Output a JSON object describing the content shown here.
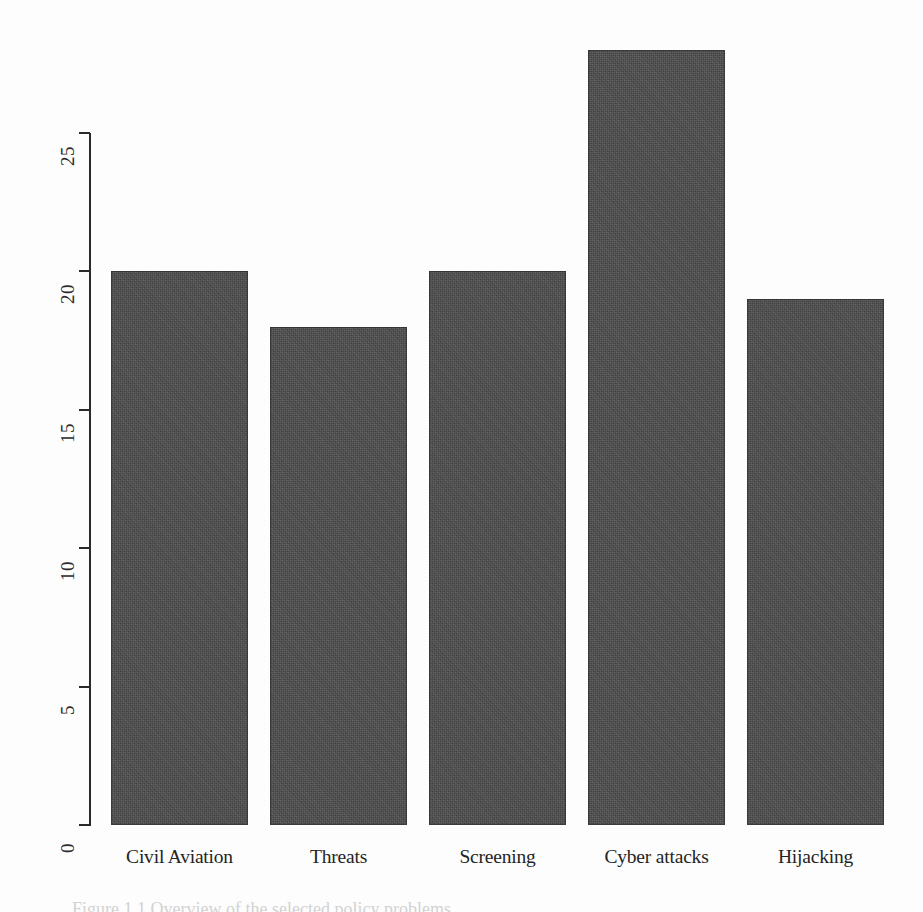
{
  "figure": {
    "background_color": "#fdfdfd",
    "bar_color": "#4c4c4c",
    "axis_color": "#2a2a2a",
    "caption_partial": "Figure 1.1 Overview of the selected policy problems"
  },
  "chart_data": {
    "type": "bar",
    "title": "",
    "subtitle": "",
    "xlabel": "",
    "ylabel": "",
    "categories": [
      "Civil Aviation",
      "Threats",
      "Screening",
      "Cyber attacks",
      "Hijacking"
    ],
    "values": [
      20,
      18,
      20,
      28,
      19
    ],
    "ylim": [
      0,
      28
    ],
    "yticks": [
      0,
      5,
      10,
      15,
      20,
      25
    ],
    "ytick_labels": [
      "0",
      "5",
      "10",
      "15",
      "20",
      "25"
    ],
    "ytick_label_rotation": -90,
    "grid": false,
    "legend": false,
    "legend_position": "none",
    "series": [
      {
        "name": "Count",
        "values": [
          20,
          18,
          20,
          28,
          19
        ]
      }
    ],
    "bars": [
      {
        "label": "Civil Aviation",
        "value": 20
      },
      {
        "label": "Threats",
        "value": 18
      },
      {
        "label": "Screening",
        "value": 20
      },
      {
        "label": "Cyber attacks",
        "value": 28
      },
      {
        "label": "Hijacking",
        "value": 19
      }
    ]
  }
}
